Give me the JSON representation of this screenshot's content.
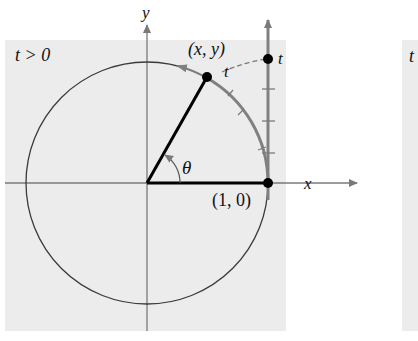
{
  "figure": {
    "condition_label": "t > 0",
    "axis_x_label": "x",
    "axis_y_label": "y",
    "point_xy_label": "(x, y)",
    "arc_length_label": "t",
    "t_line_label": "t",
    "point_10_label": "(1, 0)",
    "angle_label": "θ",
    "second_panel_partial_label": "t"
  },
  "colors": {
    "panel_bg": "#ececec",
    "circle": "#3a3a3a",
    "axis": "#7a7a7a",
    "arc_highlight": "#808080",
    "radius_line": "#000000"
  }
}
